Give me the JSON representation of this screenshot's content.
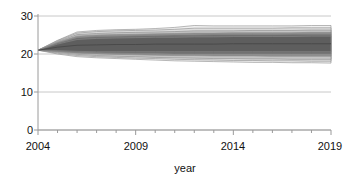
{
  "chart_data": {
    "type": "area",
    "title": "",
    "subtitle": "",
    "xlabel": "year",
    "ylabel": "",
    "xlim": [
      2004,
      2019
    ],
    "ylim": [
      0,
      30
    ],
    "grid": true,
    "legend": null,
    "x_ticks_major": [
      2004,
      2009,
      2014,
      2019
    ],
    "x_ticks_minor": [
      2005,
      2006,
      2007,
      2008,
      2010,
      2011,
      2012,
      2013,
      2015,
      2016,
      2017,
      2018
    ],
    "y_ticks": [
      0,
      10,
      20,
      30
    ],
    "x": [
      2004,
      2005,
      2006,
      2007,
      2008,
      2009,
      2010,
      2011,
      2012,
      2013,
      2014,
      2015,
      2016,
      2017,
      2018,
      2019
    ],
    "bands": [
      {
        "name": "outer-band-95",
        "color": "#f0f0f0",
        "lower": [
          21.0,
          20.0,
          19.3,
          19.0,
          18.8,
          18.6,
          18.4,
          18.2,
          18.1,
          18.0,
          17.9,
          17.8,
          17.8,
          17.7,
          17.7,
          17.6
        ],
        "upper": [
          21.0,
          23.6,
          25.8,
          26.2,
          26.4,
          26.5,
          26.7,
          27.0,
          27.5,
          27.4,
          27.4,
          27.4,
          27.4,
          27.4,
          27.5,
          27.5
        ]
      },
      {
        "name": "band-90",
        "color": "#dcdcdc",
        "lower": [
          21.0,
          20.2,
          19.6,
          19.3,
          19.1,
          18.9,
          18.8,
          18.6,
          18.5,
          18.4,
          18.3,
          18.3,
          18.2,
          18.2,
          18.1,
          18.1
        ],
        "upper": [
          21.0,
          23.5,
          25.5,
          25.9,
          26.1,
          26.2,
          26.3,
          26.5,
          26.8,
          26.8,
          26.8,
          26.8,
          26.8,
          26.9,
          26.9,
          26.9
        ]
      },
      {
        "name": "band-80",
        "color": "#c4c4c4",
        "lower": [
          21.0,
          20.4,
          19.9,
          19.6,
          19.4,
          19.3,
          19.1,
          19.0,
          18.9,
          18.8,
          18.8,
          18.7,
          18.7,
          18.6,
          18.6,
          18.6
        ],
        "upper": [
          21.0,
          23.3,
          25.1,
          25.4,
          25.6,
          25.7,
          25.8,
          25.9,
          26.1,
          26.1,
          26.1,
          26.2,
          26.2,
          26.2,
          26.3,
          26.3
        ]
      },
      {
        "name": "band-60",
        "color": "#8f8f8f",
        "lower": [
          21.0,
          20.6,
          20.2,
          20.0,
          19.9,
          19.8,
          19.7,
          19.6,
          19.6,
          19.5,
          19.5,
          19.5,
          19.4,
          19.4,
          19.4,
          19.4
        ],
        "upper": [
          21.0,
          23.1,
          24.7,
          25.0,
          25.1,
          25.2,
          25.3,
          25.4,
          25.5,
          25.5,
          25.6,
          25.6,
          25.6,
          25.6,
          25.7,
          25.7
        ]
      },
      {
        "name": "band-40",
        "color": "#6e6e6e",
        "lower": [
          21.0,
          20.7,
          20.4,
          20.3,
          20.2,
          20.1,
          20.1,
          20.0,
          20.0,
          20.0,
          20.0,
          20.0,
          20.0,
          20.0,
          20.0,
          20.0
        ],
        "upper": [
          21.0,
          22.9,
          24.3,
          24.6,
          24.7,
          24.8,
          24.9,
          25.0,
          25.0,
          25.1,
          25.1,
          25.1,
          25.1,
          25.2,
          25.2,
          25.2
        ]
      },
      {
        "name": "inner-band-20",
        "color": "#5e5e5e",
        "lower": [
          21.0,
          20.9,
          20.7,
          20.6,
          20.6,
          20.6,
          20.6,
          20.6,
          20.6,
          20.6,
          20.6,
          20.6,
          20.6,
          20.6,
          20.6,
          20.6
        ],
        "upper": [
          21.0,
          22.6,
          23.8,
          24.1,
          24.2,
          24.3,
          24.4,
          24.4,
          24.5,
          24.5,
          24.6,
          24.6,
          24.6,
          24.6,
          24.7,
          24.7
        ]
      }
    ],
    "median": {
      "name": "median-line",
      "color": "#4a4a4a",
      "values": [
        21.0,
        21.8,
        22.3,
        22.4,
        22.5,
        22.5,
        22.6,
        22.6,
        22.6,
        22.6,
        22.7,
        22.7,
        22.7,
        22.7,
        22.7,
        22.7
      ]
    }
  },
  "axes": {
    "x_axis_label": "year",
    "y_tick_labels": [
      "30",
      "20",
      "10",
      "0"
    ],
    "x_tick_labels": [
      "2004",
      "2009",
      "2014",
      "2019"
    ]
  },
  "colors": {
    "background": "#ffffff",
    "axis": "#9a9a9a",
    "gridline": "#c8c8c8",
    "text": "#111111",
    "band_outline": "#8a8a8a"
  }
}
